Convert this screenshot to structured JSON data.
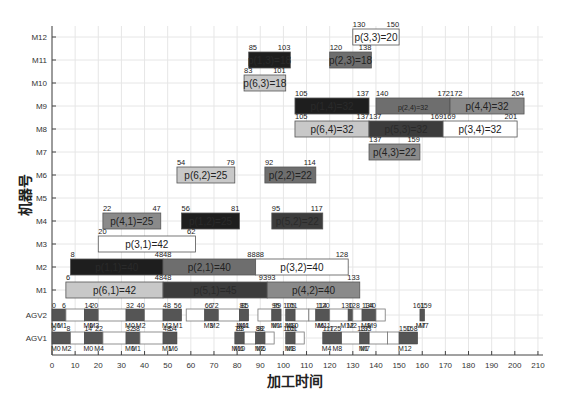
{
  "chart_data": {
    "type": "gantt",
    "title": "",
    "xlabel": "加工时间",
    "ylabel": "机器号",
    "xlim": [
      0,
      212
    ],
    "xticks": [
      0,
      10,
      20,
      30,
      40,
      50,
      60,
      70,
      80,
      90,
      100,
      110,
      120,
      130,
      140,
      150,
      160,
      170,
      180,
      190,
      200,
      210
    ],
    "grid": true,
    "rows": [
      "M12",
      "M11",
      "M10",
      "M9",
      "M8",
      "M7",
      "M6",
      "M5",
      "M4",
      "M3",
      "M2",
      "M1",
      "AGV2",
      "AGV1"
    ],
    "colors": {
      "job1": "#1e1e1e",
      "job2": "#6e6e6e",
      "job3": "#ffffff",
      "job4": "#8a8a8a",
      "job5": "#3c3c3c",
      "job6": "#c8c8c8"
    },
    "operations": [
      {
        "row": "M12",
        "job": 3,
        "label": "p(3,3)=20",
        "start": 130,
        "end": 150
      },
      {
        "row": "M11",
        "job": 1,
        "label": "p(1,3)=18",
        "start": 85,
        "end": 103
      },
      {
        "row": "M11",
        "job": 2,
        "label": "p(2,3)=18",
        "start": 120,
        "end": 138
      },
      {
        "row": "M10",
        "job": 6,
        "label": "p(6,3)=18",
        "start": 83,
        "end": 101
      },
      {
        "row": "M9",
        "job": 1,
        "label": "p(1,4)=32",
        "start": 105,
        "end": 137
      },
      {
        "row": "M9",
        "job": 2,
        "label": "p(2,4)=32",
        "start": 140,
        "end": 172
      },
      {
        "row": "M9",
        "job": 4,
        "label": "p(4,4)=32",
        "start": 172,
        "end": 204
      },
      {
        "row": "M8",
        "job": 6,
        "label": "p(6,4)=32",
        "start": 105,
        "end": 137
      },
      {
        "row": "M8",
        "job": 5,
        "label": "p(5,3)=32",
        "start": 137,
        "end": 169
      },
      {
        "row": "M8",
        "job": 3,
        "label": "p(3,4)=32",
        "start": 169,
        "end": 201
      },
      {
        "row": "M7",
        "job": 4,
        "label": "p(4,3)=22",
        "start": 137,
        "end": 159
      },
      {
        "row": "M6",
        "job": 6,
        "label": "p(6,2)=25",
        "start": 54,
        "end": 79
      },
      {
        "row": "M6",
        "job": 2,
        "label": "p(2,2)=22",
        "start": 92,
        "end": 114
      },
      {
        "row": "M4",
        "job": 4,
        "label": "p(4,1)=25",
        "start": 22,
        "end": 47
      },
      {
        "row": "M4",
        "job": 1,
        "label": "p(1,2)=25",
        "start": 56,
        "end": 81
      },
      {
        "row": "M4",
        "job": 5,
        "label": "p(5,2)=22",
        "start": 95,
        "end": 117
      },
      {
        "row": "M3",
        "job": 3,
        "label": "p(3,1)=42",
        "start": 20,
        "end": 62
      },
      {
        "row": "M2",
        "job": 1,
        "label": "p(1,1)=40",
        "start": 8,
        "end": 48
      },
      {
        "row": "M2",
        "job": 2,
        "label": "p(2,1)=40",
        "start": 48,
        "end": 88
      },
      {
        "row": "M2",
        "job": 3,
        "label": "p(3,2)=40",
        "start": 88,
        "end": 128
      },
      {
        "row": "M1",
        "job": 6,
        "label": "p(6,1)=42",
        "start": 6,
        "end": 48
      },
      {
        "row": "M1",
        "job": 5,
        "label": "p(5,1)=45",
        "start": 48,
        "end": 93
      },
      {
        "row": "M1",
        "job": 4,
        "label": "p(4,2)=40",
        "start": 93,
        "end": 133
      }
    ],
    "agv_tasks": [
      {
        "row": "AGV2",
        "start": 0,
        "end": 6,
        "from": "M0",
        "to": "M1",
        "empty_end": 0
      },
      {
        "row": "AGV2",
        "start": 14,
        "end": 20,
        "from": "M0",
        "to": "M3",
        "empty_start": 6,
        "empty_end": 14
      },
      {
        "row": "AGV2",
        "start": 32,
        "end": 40,
        "from": "M0",
        "to": "M2",
        "empty_start": 20,
        "empty_end": 32
      },
      {
        "row": "AGV2",
        "start": 48,
        "end": 56,
        "from": "M2",
        "to": "M1",
        "empty_start": 40,
        "empty_end": 48
      },
      {
        "row": "AGV2",
        "start": 66,
        "end": 72,
        "from": "M3",
        "to": "M2",
        "empty_start": 58,
        "empty_end": 66
      },
      {
        "row": "AGV2",
        "start": 81,
        "end": 85,
        "from": "M4",
        "to": "M11",
        "empty_start": 72,
        "empty_end": 81
      },
      {
        "row": "AGV2",
        "start": 95,
        "end": 99,
        "from": "M1",
        "to": "M4",
        "empty_start": 89,
        "empty_end": 95
      },
      {
        "row": "AGV2",
        "start": 101,
        "end": 105,
        "from": "M10",
        "to": "M9",
        "empty_start": 105,
        "empty_end": 111
      },
      {
        "row": "AGV2",
        "start": 114,
        "end": 120,
        "from": "M6",
        "to": "M11",
        "empty_start": 111,
        "empty_end": 114
      },
      {
        "row": "AGV2",
        "start": 128,
        "end": 130,
        "from": "M2",
        "to": "M12",
        "empty_start": 120,
        "empty_end": 128
      },
      {
        "row": "AGV2",
        "start": 134,
        "end": 140,
        "from": "M9",
        "to": "M9",
        "empty_start": 130,
        "empty_end": 134
      },
      {
        "row": "AGV2",
        "start": 159,
        "end": 161,
        "from": "M7",
        "to": "M7",
        "empty_start": 140,
        "empty_end": 144
      },
      {
        "row": "AGV1",
        "start": 0,
        "end": 8,
        "from": "M0",
        "to": "M2"
      },
      {
        "row": "AGV1",
        "start": 14,
        "end": 22,
        "from": "M0",
        "to": "M4",
        "empty_start": 8,
        "empty_end": 14
      },
      {
        "row": "AGV1",
        "start": 32,
        "end": 38,
        "from": "M0",
        "to": "M1",
        "empty_start": 22,
        "empty_end": 32
      },
      {
        "row": "AGV1",
        "start": 48,
        "end": 54,
        "from": "M1",
        "to": "M6",
        "empty_start": 38,
        "empty_end": 48
      },
      {
        "row": "AGV1",
        "start": 79,
        "end": 83,
        "from": "M6",
        "to": "M10",
        "empty_start": 83,
        "empty_end": 88
      },
      {
        "row": "AGV1",
        "start": 88,
        "end": 92,
        "from": "M2",
        "to": "M6",
        "empty_start": 92,
        "empty_end": 96
      },
      {
        "row": "AGV1",
        "start": 101,
        "end": 105,
        "from": "M1",
        "to": "M8",
        "empty_start": 105,
        "empty_end": 109
      },
      {
        "row": "AGV1",
        "start": 117,
        "end": 125,
        "from": "M4",
        "to": "M8",
        "empty_start": 125,
        "empty_end": 133
      },
      {
        "row": "AGV1",
        "start": 133,
        "end": 137,
        "from": "M1",
        "to": "M7",
        "empty_start": 137,
        "empty_end": 145
      },
      {
        "row": "AGV1",
        "start": 150,
        "end": 158,
        "from": "M12",
        "to": "",
        "empty_start": 145,
        "empty_end": 150
      }
    ],
    "agv_time_labels": {
      "AGV2": [
        "0",
        "6",
        "14",
        "20",
        "32",
        "40",
        "48",
        "56",
        "58",
        "66",
        "72",
        "79",
        "81",
        "85",
        "89",
        "93",
        "95",
        "99",
        "101",
        "105",
        "111",
        "114",
        "120",
        "128",
        "130",
        "134",
        "140",
        "144",
        "159",
        "161"
      ],
      "AGV1": [
        "0",
        "8",
        "14",
        "22",
        "32",
        "38",
        "48",
        "54",
        "79",
        "83",
        "88",
        "92",
        "96",
        "101",
        "105",
        "109",
        "117",
        "125",
        "133",
        "137",
        "145",
        "150",
        "158"
      ]
    },
    "agv_loc_labels": {
      "AGV2": [
        "M0",
        "M1",
        "M0",
        "M3",
        "M0",
        "M2",
        "M2",
        "M1",
        "M3",
        "M2",
        "M4",
        "M11",
        "M1",
        "M4",
        "M10",
        "M9",
        "M6",
        "M11",
        "M2",
        "M12",
        "M9",
        "M7"
      ],
      "AGV1": [
        "M0",
        "M2",
        "M0",
        "M4",
        "M0",
        "M1",
        "M1",
        "M6",
        "M6",
        "M10",
        "M2",
        "M6",
        "M1",
        "M8",
        "M4",
        "M8",
        "M1",
        "M7",
        "M12"
      ]
    }
  }
}
